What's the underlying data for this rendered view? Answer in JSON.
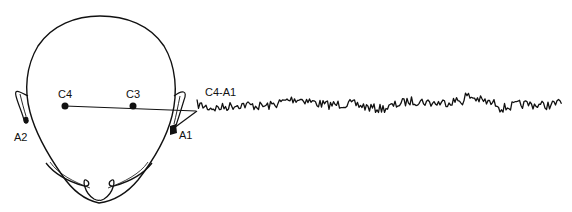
{
  "diagram": {
    "type": "eeg-electrode-montage",
    "ink_color": "#111111",
    "background": "#ffffff",
    "electrodes": [
      {
        "id": "C4",
        "label": "C4",
        "x": 65,
        "y": 106
      },
      {
        "id": "C3",
        "label": "C3",
        "x": 133,
        "y": 106
      },
      {
        "id": "A2",
        "label": "A2",
        "x": 24,
        "y": 120
      },
      {
        "id": "A1",
        "label": "A1",
        "x": 172,
        "y": 131
      }
    ],
    "derivation": {
      "label": "C4-A1",
      "from": "C4",
      "to": "A1"
    },
    "waveform": {
      "start_x": 197,
      "end_x": 562,
      "baseline_y": 104,
      "description": "EEG trace, low-amplitude mixed-frequency activity"
    }
  }
}
